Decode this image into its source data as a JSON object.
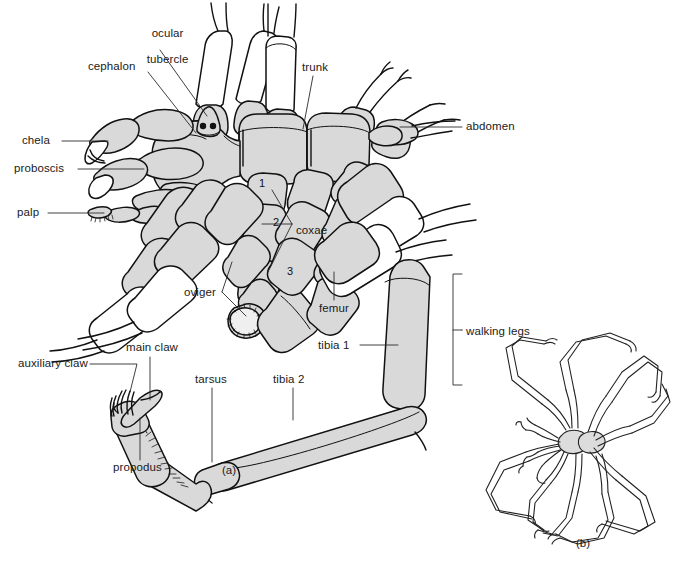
{
  "figure": {
    "background_color": "#ffffff",
    "body_fill_color": "#d9d9d9",
    "outline_color": "#111111",
    "leader_line_color": "#2a2a2a",
    "panels": [
      {
        "id": "a",
        "caption": "(a)",
        "description": "Dorsal view of sea spider with labelled appendages"
      },
      {
        "id": "b",
        "caption": "(b)",
        "description": "Outline sketch of long-legged sea spider"
      }
    ],
    "captions": {
      "panel_a": "(a)",
      "panel_b": "(b)"
    },
    "labels": [
      {
        "key": "ocular_tubercle",
        "text": "ocular\ntubercle",
        "align": "center"
      },
      {
        "key": "cephalon",
        "text": "cephalon",
        "align": "left"
      },
      {
        "key": "trunk",
        "text": "trunk",
        "align": "left"
      },
      {
        "key": "abdomen",
        "text": "abdomen",
        "align": "left"
      },
      {
        "key": "chela",
        "text": "chela",
        "align": "left"
      },
      {
        "key": "proboscis",
        "text": "proboscis",
        "align": "left"
      },
      {
        "key": "palp",
        "text": "palp",
        "align": "left"
      },
      {
        "key": "coxae",
        "text": "coxae",
        "align": "left"
      },
      {
        "key": "oviger",
        "text": "oviger",
        "align": "left"
      },
      {
        "key": "femur",
        "text": "femur",
        "align": "left"
      },
      {
        "key": "tibia_1",
        "text": "tibia 1",
        "align": "left"
      },
      {
        "key": "tibia_2",
        "text": "tibia 2",
        "align": "left"
      },
      {
        "key": "tarsus",
        "text": "tarsus",
        "align": "left"
      },
      {
        "key": "propodus",
        "text": "propodus",
        "align": "left"
      },
      {
        "key": "main_claw",
        "text": "main claw",
        "align": "left"
      },
      {
        "key": "auxiliary_claw",
        "text": "auxiliary claw",
        "align": "left"
      },
      {
        "key": "walking_legs",
        "text": "walking legs",
        "align": "left"
      }
    ],
    "coxa_numbers": [
      "1",
      "2",
      "3"
    ],
    "label_text": {
      "ocular_tubercle_line1": "ocular",
      "ocular_tubercle_line2": "tubercle",
      "cephalon": "cephalon",
      "trunk": "trunk",
      "abdomen": "abdomen",
      "chela": "chela",
      "proboscis": "proboscis",
      "palp": "palp",
      "coxae": "coxae",
      "oviger": "oviger",
      "femur": "femur",
      "tibia_1": "tibia 1",
      "tibia_2": "tibia 2",
      "tarsus": "tarsus",
      "propodus": "propodus",
      "main_claw": "main claw",
      "auxiliary_claw": "auxiliary claw",
      "walking_legs": "walking legs",
      "coxa_1": "1",
      "coxa_2": "2",
      "coxa_3": "3"
    }
  }
}
